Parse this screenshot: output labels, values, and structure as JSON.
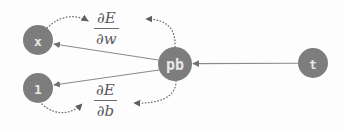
{
  "diagram": {
    "background_color": "#fdfdfd",
    "node_fill_color": "#7d7d7d",
    "node_text_color": "#e8e8e8",
    "edge_color": "#8a8a8a",
    "dotted_edge_color": "#6f6f6f",
    "nodes": [
      {
        "id": "x",
        "label": "x",
        "cx": 38,
        "cy": 40,
        "r": 15
      },
      {
        "id": "one",
        "label": "1",
        "cx": 38,
        "cy": 88,
        "r": 15
      },
      {
        "id": "pb",
        "label": "pb",
        "cx": 175,
        "cy": 64,
        "r": 17
      },
      {
        "id": "t",
        "label": "t",
        "cx": 313,
        "cy": 63,
        "r": 15
      }
    ],
    "labels": [
      {
        "id": "dEdw",
        "numerator": "∂E",
        "denominator": "∂w"
      },
      {
        "id": "dEdb",
        "numerator": "∂E",
        "denominator": "∂b"
      }
    ],
    "edges": [
      {
        "id": "pb-to-x",
        "from": "pb",
        "to": "x",
        "style": "solid",
        "arrow": "to"
      },
      {
        "id": "pb-to-one",
        "from": "pb",
        "to": "one",
        "style": "solid",
        "arrow": "to"
      },
      {
        "id": "t-to-pb",
        "from": "t",
        "to": "pb",
        "style": "solid",
        "arrow": "to"
      },
      {
        "id": "x-to-dEdw",
        "from": "x",
        "to": "dEdw",
        "style": "dotted",
        "arrow": "to"
      },
      {
        "id": "pb-to-dEdw",
        "from": "pb",
        "to": "dEdw",
        "style": "dotted",
        "arrow": "to"
      },
      {
        "id": "one-to-dEdb",
        "from": "one",
        "to": "dEdb",
        "style": "dotted",
        "arrow": "to"
      },
      {
        "id": "pb-to-dEdb",
        "from": "pb",
        "to": "dEdb",
        "style": "dotted",
        "arrow": "to"
      }
    ]
  }
}
